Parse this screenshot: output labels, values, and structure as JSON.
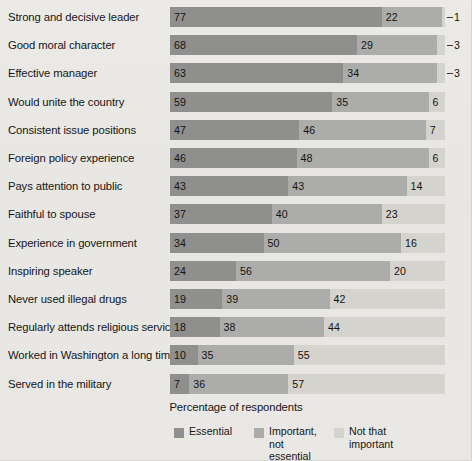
{
  "chart_data": {
    "type": "bar",
    "orientation": "horizontal",
    "stacked": true,
    "normalized_percent": true,
    "title": "",
    "subtitle": "",
    "xlabel": "Percentage of respondents",
    "ylabel": "",
    "xlim": [
      0,
      100
    ],
    "grid": false,
    "legend_position": "bottom",
    "categories": [
      "Strong and decisive leader",
      "Good moral character",
      "Effective manager",
      "Would unite the country",
      "Consistent issue positions",
      "Foreign policy experience",
      "Pays attention to public",
      "Faithful to spouse",
      "Experience in government",
      "Inspiring speaker",
      "Never used illegal drugs",
      "Regularly attends religious services",
      "Worked in Washington a long time",
      "Served in the military"
    ],
    "series": [
      {
        "name": "Essential",
        "color": "#8f8f8d",
        "values": [
          77,
          68,
          63,
          59,
          47,
          46,
          43,
          37,
          34,
          24,
          19,
          18,
          10,
          7
        ]
      },
      {
        "name": "Important, not essential",
        "color": "#acacaa",
        "values": [
          22,
          29,
          34,
          35,
          46,
          48,
          43,
          40,
          50,
          56,
          39,
          38,
          35,
          36
        ]
      },
      {
        "name": "Not that important",
        "color": "#d5d3ce",
        "values": [
          1,
          3,
          3,
          6,
          7,
          6,
          14,
          23,
          16,
          20,
          42,
          44,
          55,
          57
        ]
      }
    ],
    "label_placement_note": "Third-segment labels for the first three rows are drawn outside the bar with a leader dash."
  },
  "legend": {
    "items": [
      {
        "label": "Essential",
        "color": "#8f8f8d"
      },
      {
        "label": "Important,\nnot essential",
        "color": "#acacaa"
      },
      {
        "label": "Not that\nimportant",
        "color": "#d5d3ce"
      }
    ]
  },
  "axis": {
    "title": "Percentage of respondents"
  }
}
